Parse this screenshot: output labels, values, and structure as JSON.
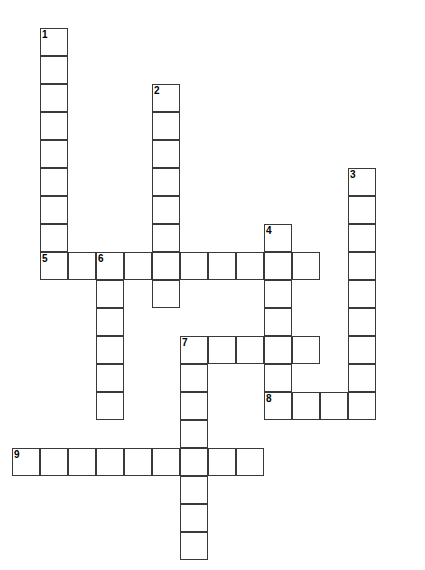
{
  "puzzle": {
    "title": "Crossword Puzzle Grid",
    "cell_size_px": 28,
    "origin_x_px": 12,
    "origin_y_px": 28,
    "grid_cols": 15,
    "grid_rows": 20,
    "colors": {
      "background": "#ffffff",
      "cell_fill": "#ffffff",
      "cell_border": "#3a3a3a",
      "number_text": "#000000"
    },
    "entries": [
      {
        "number": "1",
        "direction": "down",
        "start_col": 1,
        "start_row": 0,
        "length": 9,
        "answer": ""
      },
      {
        "number": "2",
        "direction": "down",
        "start_col": 5,
        "start_row": 2,
        "length": 8,
        "answer": ""
      },
      {
        "number": "3",
        "direction": "down",
        "start_col": 12,
        "start_row": 5,
        "length": 8,
        "answer": ""
      },
      {
        "number": "4",
        "direction": "down",
        "start_col": 9,
        "start_row": 7,
        "length": 7,
        "answer": ""
      },
      {
        "number": "5",
        "direction": "across",
        "start_col": 1,
        "start_row": 8,
        "length": 10,
        "answer": ""
      },
      {
        "number": "6",
        "direction": "down",
        "start_col": 3,
        "start_row": 8,
        "length": 6,
        "answer": ""
      },
      {
        "number": "7",
        "direction": "across",
        "start_col": 6,
        "start_row": 11,
        "length": 5,
        "answer": ""
      },
      {
        "number": "7",
        "direction": "down",
        "start_col": 6,
        "start_row": 11,
        "length": 8,
        "answer": ""
      },
      {
        "number": "8",
        "direction": "across",
        "start_col": 9,
        "start_row": 13,
        "length": 4,
        "answer": ""
      },
      {
        "number": "9",
        "direction": "across",
        "start_col": 0,
        "start_row": 15,
        "length": 9,
        "answer": ""
      }
    ],
    "numbered_cells": [
      {
        "number": "1",
        "col": 1,
        "row": 0
      },
      {
        "number": "2",
        "col": 5,
        "row": 2
      },
      {
        "number": "3",
        "col": 12,
        "row": 5
      },
      {
        "number": "4",
        "col": 9,
        "row": 7
      },
      {
        "number": "5",
        "col": 1,
        "row": 8
      },
      {
        "number": "6",
        "col": 3,
        "row": 8
      },
      {
        "number": "7",
        "col": 6,
        "row": 11
      },
      {
        "number": "8",
        "col": 9,
        "row": 13
      },
      {
        "number": "9",
        "col": 0,
        "row": 15
      }
    ]
  }
}
